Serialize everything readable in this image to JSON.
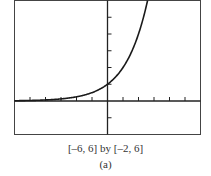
{
  "chart_data": {
    "type": "line",
    "title": "",
    "function": "y = 2^x",
    "xlabel": "",
    "ylabel": "",
    "xlim": [
      -6,
      6
    ],
    "ylim": [
      -2,
      6
    ],
    "xscale": 1,
    "yscale": 1,
    "grid": false,
    "series": [
      {
        "name": "curve",
        "x": [
          -6,
          -5,
          -4,
          -3,
          -2,
          -1,
          0,
          1,
          2,
          2.585
        ],
        "y": [
          0.016,
          0.031,
          0.063,
          0.125,
          0.25,
          0.5,
          1,
          2,
          4,
          6
        ]
      }
    ],
    "annotations": [
      "[-6, 6] by [-2, 6]",
      "(a)"
    ]
  },
  "caption": {
    "window": "[–6, 6] by [–2, 6]",
    "label": "(a)"
  },
  "style": {
    "axis_color": "#222222",
    "curve_color": "#1a1a1a",
    "frame_color": "#444444"
  }
}
